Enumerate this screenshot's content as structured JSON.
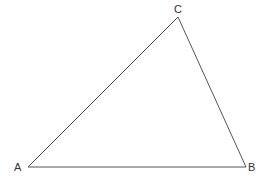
{
  "diagram": {
    "type": "triangle",
    "stroke_color": "#555555",
    "vertices": [
      {
        "name": "A",
        "label": "A",
        "x": 28,
        "y": 167,
        "label_x": 14,
        "label_y": 171
      },
      {
        "name": "B",
        "label": "B",
        "x": 246,
        "y": 167,
        "label_x": 248,
        "label_y": 171
      },
      {
        "name": "C",
        "label": "C",
        "x": 178,
        "y": 17,
        "label_x": 174,
        "label_y": 13
      }
    ]
  }
}
